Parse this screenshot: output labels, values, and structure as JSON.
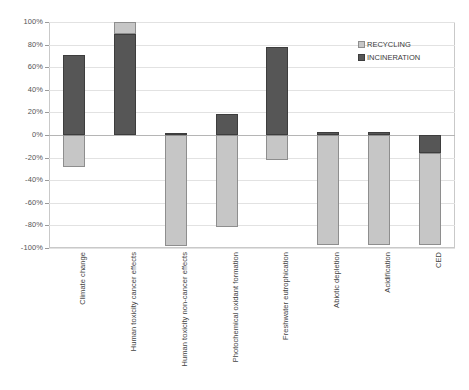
{
  "chart_data": {
    "type": "bar",
    "title": "",
    "subtitle": "",
    "xlabel": "",
    "ylabel": "",
    "ylim": [
      -100,
      100
    ],
    "ytick_step": 20,
    "ytick_labels": [
      "100%",
      "80%",
      "60%",
      "40%",
      "20%",
      "0%",
      "-20%",
      "-40%",
      "-60%",
      "-80%",
      "-100%"
    ],
    "ytick_values": [
      100,
      80,
      60,
      40,
      20,
      0,
      -20,
      -40,
      -60,
      -80,
      -100
    ],
    "grid": true,
    "stacked": true,
    "legend_position": "top-right",
    "categories": [
      "Climate change",
      "Human toxicity cancer effects",
      "Human toxicity non-cancer effects",
      "Photochemical oxidant formation",
      "Freshwater eutrophication",
      "Abiotic depletion",
      "Acidification",
      "CED"
    ],
    "series": [
      {
        "name": "RECYCLING",
        "color": "#c6c6c6",
        "values": [
          -28,
          11,
          -98,
          -81,
          -22,
          -97,
          -97,
          -81
        ]
      },
      {
        "name": "INCINERATION",
        "color": "#565656",
        "values": [
          71,
          89,
          2,
          19,
          78,
          3,
          3,
          -16
        ]
      }
    ],
    "bars": [
      {
        "category": "Climate change",
        "incineration_top": 71,
        "incineration_bottom": 0,
        "recycling_top": 0,
        "recycling_bottom": -28
      },
      {
        "category": "Human toxicity cancer effects",
        "incineration_top": 89,
        "incineration_bottom": 0,
        "recycling_top": 100,
        "recycling_bottom": 89
      },
      {
        "category": "Human toxicity non-cancer effects",
        "incineration_top": 2,
        "incineration_bottom": 0,
        "recycling_top": 0,
        "recycling_bottom": -98
      },
      {
        "category": "Photochemical oxidant formation",
        "incineration_top": 19,
        "incineration_bottom": 0,
        "recycling_top": 0,
        "recycling_bottom": -81
      },
      {
        "category": "Freshwater eutrophication",
        "incineration_top": 78,
        "incineration_bottom": 0,
        "recycling_top": 0,
        "recycling_bottom": -22
      },
      {
        "category": "Abiotic depletion",
        "incineration_top": 3,
        "incineration_bottom": 0,
        "recycling_top": 0,
        "recycling_bottom": -97
      },
      {
        "category": "Acidification",
        "incineration_top": 3,
        "incineration_bottom": 0,
        "recycling_top": 0,
        "recycling_bottom": -97
      },
      {
        "category": "CED",
        "incineration_top": 0,
        "incineration_bottom": -16,
        "recycling_top": -16,
        "recycling_bottom": -97
      }
    ]
  },
  "legend": {
    "items": [
      {
        "label": "RECYCLING",
        "color": "#c6c6c6"
      },
      {
        "label": "INCINERATION",
        "color": "#565656"
      }
    ]
  },
  "axis": {
    "y_labels": [
      "100%",
      "80%",
      "60%",
      "40%",
      "20%",
      "0%",
      "-20%",
      "-40%",
      "-60%",
      "-80%",
      "-100%"
    ],
    "x_labels": [
      "Climate change",
      "Human toxicity cancer effects",
      "Human toxicity non-cancer effects",
      "Photochemical oxidant formation",
      "Freshwater eutrophication",
      "Abiotic depletion",
      "Acidification",
      "CED"
    ]
  }
}
